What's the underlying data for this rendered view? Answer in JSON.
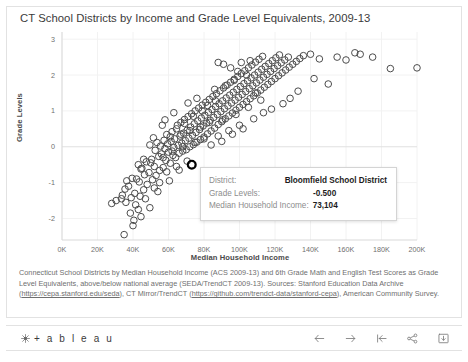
{
  "chart_title": "CT School Districts by Income and Grade Level Equivalents, 2009-13",
  "axis": {
    "ytitle": "Grade Levels",
    "xtitle": "Median Household Income",
    "xticks": [
      "0K",
      "20K",
      "40K",
      "60K",
      "80K",
      "100K",
      "120K",
      "140K",
      "160K",
      "180K",
      "200K"
    ],
    "yticks": [
      "3",
      "2",
      "1",
      "0",
      "-1",
      "-2"
    ]
  },
  "tooltip": {
    "district_label": "District:",
    "district_value": "Bloomfield School District",
    "grade_label": "Grade Levels:",
    "grade_value": "-0.500",
    "income_label": "Median Household Income:",
    "income_value": "73,104"
  },
  "caption": {
    "part1": "Connecticut School Districts by Median Household Income (ACS 2009-13) and 6th Grade Math and English Test Scores as Grade Level Equivalents, above/below national average (SEDA/TrendCT 2009-13). Sources: Stanford Education Data Archive (",
    "link1": "https://cepa.stanford.edu/seda",
    "part2": "), CT Mirror/TrendCT (",
    "link2": "https://github.com/trendct-data/stanford-cepa",
    "part3": "), American Community Survey."
  },
  "toolbar": {
    "brand": "+ a b l e a u",
    "icons": [
      {
        "name": "back-arrow-icon",
        "label": "Back"
      },
      {
        "name": "forward-arrow-icon",
        "label": "Forward"
      },
      {
        "name": "revert-icon",
        "label": "Revert"
      },
      {
        "name": "share-icon",
        "label": "Share"
      },
      {
        "name": "download-icon",
        "label": "Download"
      }
    ]
  },
  "colors": {
    "marker_stroke": "#4c4c4c",
    "highlight_stroke": "#000000",
    "grid": "#f2f2f2",
    "axis": "#d9d9d9",
    "text": "#6f6f6f"
  },
  "chart_data": {
    "type": "scatter",
    "title": "CT School Districts by Income and Grade Level Equivalents, 2009-13",
    "xlabel": "Median Household Income",
    "ylabel": "Grade Levels",
    "xlim": [
      0,
      200000
    ],
    "ylim": [
      -2.6,
      3.2
    ],
    "grid": true,
    "legend": null,
    "marker": "open-circle",
    "highlighted_point": {
      "label": "Bloomfield School District",
      "x": 73104,
      "y": -0.5
    },
    "points": [
      [
        35000,
        -2.45
      ],
      [
        40000,
        -2.2
      ],
      [
        38500,
        -1.85
      ],
      [
        43000,
        -1.75
      ],
      [
        41500,
        -1.62
      ],
      [
        36000,
        -1.55
      ],
      [
        28000,
        -1.58
      ],
      [
        33500,
        -1.45
      ],
      [
        39000,
        -1.42
      ],
      [
        44000,
        -1.38
      ],
      [
        41000,
        -1.3
      ],
      [
        46000,
        -1.2
      ],
      [
        35500,
        -1.18
      ],
      [
        48000,
        -1.05
      ],
      [
        43500,
        -0.98
      ],
      [
        51000,
        -0.92
      ],
      [
        39500,
        -0.88
      ],
      [
        53000,
        -0.8
      ],
      [
        46500,
        -0.78
      ],
      [
        49000,
        -0.72
      ],
      [
        55000,
        -0.66
      ],
      [
        44500,
        -0.62
      ],
      [
        57000,
        -0.58
      ],
      [
        52000,
        -0.55
      ],
      [
        73104,
        -0.5
      ],
      [
        61000,
        -0.46
      ],
      [
        47500,
        -0.42
      ],
      [
        58500,
        -0.38
      ],
      [
        50500,
        -0.35
      ],
      [
        64000,
        -0.3
      ],
      [
        54500,
        -0.27
      ],
      [
        62500,
        -0.24
      ],
      [
        56000,
        -0.2
      ],
      [
        66000,
        -0.18
      ],
      [
        60000,
        -0.15
      ],
      [
        68000,
        -0.12
      ],
      [
        52500,
        -0.1
      ],
      [
        70000,
        -0.08
      ],
      [
        58000,
        -0.05
      ],
      [
        63000,
        -0.02
      ],
      [
        72000,
        0.0
      ],
      [
        55500,
        0.02
      ],
      [
        65500,
        0.04
      ],
      [
        49500,
        0.05
      ],
      [
        74000,
        0.06
      ],
      [
        59500,
        0.08
      ],
      [
        67500,
        0.1
      ],
      [
        53500,
        0.12
      ],
      [
        76000,
        0.13
      ],
      [
        61500,
        0.15
      ],
      [
        69500,
        0.17
      ],
      [
        57500,
        0.18
      ],
      [
        78000,
        0.2
      ],
      [
        63500,
        0.22
      ],
      [
        71500,
        0.24
      ],
      [
        51500,
        0.25
      ],
      [
        80000,
        0.27
      ],
      [
        66500,
        0.3
      ],
      [
        73500,
        0.32
      ],
      [
        59000,
        0.34
      ],
      [
        82000,
        0.36
      ],
      [
        68500,
        0.38
      ],
      [
        75500,
        0.4
      ],
      [
        62000,
        0.42
      ],
      [
        84000,
        0.44
      ],
      [
        70500,
        0.46
      ],
      [
        77500,
        0.48
      ],
      [
        64500,
        0.5
      ],
      [
        86000,
        0.52
      ],
      [
        72500,
        0.55
      ],
      [
        79500,
        0.58
      ],
      [
        56500,
        0.6
      ],
      [
        88000,
        0.62
      ],
      [
        74500,
        0.64
      ],
      [
        81500,
        0.66
      ],
      [
        67000,
        0.68
      ],
      [
        90000,
        0.7
      ],
      [
        76500,
        0.72
      ],
      [
        83500,
        0.74
      ],
      [
        69000,
        0.76
      ],
      [
        92000,
        0.78
      ],
      [
        78500,
        0.8
      ],
      [
        85500,
        0.82
      ],
      [
        71000,
        0.84
      ],
      [
        94000,
        0.86
      ],
      [
        80500,
        0.88
      ],
      [
        87500,
        0.9
      ],
      [
        73000,
        0.92
      ],
      [
        96000,
        0.94
      ],
      [
        82500,
        0.96
      ],
      [
        89500,
        0.98
      ],
      [
        75000,
        1.0
      ],
      [
        98000,
        1.02
      ],
      [
        84500,
        1.04
      ],
      [
        91500,
        1.06
      ],
      [
        77000,
        1.08
      ],
      [
        100000,
        1.1
      ],
      [
        86500,
        1.12
      ],
      [
        93500,
        1.14
      ],
      [
        79000,
        1.16
      ],
      [
        102000,
        1.18
      ],
      [
        88500,
        1.2
      ],
      [
        95500,
        1.22
      ],
      [
        81000,
        1.24
      ],
      [
        104000,
        1.26
      ],
      [
        90500,
        1.28
      ],
      [
        97500,
        1.3
      ],
      [
        83000,
        1.32
      ],
      [
        106000,
        1.34
      ],
      [
        92500,
        1.36
      ],
      [
        99500,
        1.38
      ],
      [
        85000,
        1.4
      ],
      [
        108000,
        1.42
      ],
      [
        94500,
        1.44
      ],
      [
        101500,
        1.46
      ],
      [
        87000,
        1.48
      ],
      [
        110000,
        1.5
      ],
      [
        96500,
        1.52
      ],
      [
        103500,
        1.54
      ],
      [
        89000,
        1.56
      ],
      [
        112000,
        1.58
      ],
      [
        98500,
        1.6
      ],
      [
        105500,
        1.62
      ],
      [
        91000,
        1.64
      ],
      [
        114000,
        1.66
      ],
      [
        100500,
        1.68
      ],
      [
        107500,
        1.7
      ],
      [
        93000,
        1.72
      ],
      [
        116000,
        1.74
      ],
      [
        102500,
        1.76
      ],
      [
        109500,
        1.78
      ],
      [
        95000,
        1.8
      ],
      [
        118000,
        1.82
      ],
      [
        104500,
        1.84
      ],
      [
        111500,
        1.86
      ],
      [
        97000,
        1.88
      ],
      [
        120000,
        1.9
      ],
      [
        106500,
        1.92
      ],
      [
        113500,
        1.94
      ],
      [
        99000,
        1.96
      ],
      [
        122000,
        1.98
      ],
      [
        108500,
        2.0
      ],
      [
        115500,
        2.02
      ],
      [
        101000,
        2.04
      ],
      [
        124000,
        2.06
      ],
      [
        110500,
        2.08
      ],
      [
        117500,
        2.1
      ],
      [
        103000,
        2.12
      ],
      [
        126000,
        2.14
      ],
      [
        112500,
        2.16
      ],
      [
        119500,
        2.18
      ],
      [
        105000,
        2.2
      ],
      [
        128000,
        2.22
      ],
      [
        114500,
        2.24
      ],
      [
        121500,
        2.26
      ],
      [
        107000,
        2.28
      ],
      [
        130000,
        2.3
      ],
      [
        116500,
        2.32
      ],
      [
        123500,
        2.34
      ],
      [
        109000,
        2.36
      ],
      [
        132000,
        2.38
      ],
      [
        118500,
        2.4
      ],
      [
        125500,
        2.42
      ],
      [
        111000,
        2.44
      ],
      [
        134000,
        2.46
      ],
      [
        120500,
        2.48
      ],
      [
        127500,
        2.5
      ],
      [
        113000,
        2.52
      ],
      [
        136000,
        2.54
      ],
      [
        122500,
        2.56
      ],
      [
        140000,
        2.58
      ],
      [
        145000,
        2.45
      ],
      [
        155000,
        2.5
      ],
      [
        160000,
        2.42
      ],
      [
        165000,
        2.62
      ],
      [
        168000,
        2.58
      ],
      [
        175000,
        2.5
      ],
      [
        185000,
        2.18
      ],
      [
        200000,
        2.2
      ],
      [
        205000,
        2.3
      ],
      [
        142000,
        1.9
      ],
      [
        150000,
        1.75
      ],
      [
        133000,
        1.55
      ],
      [
        128500,
        1.35
      ],
      [
        124500,
        1.2
      ],
      [
        118000,
        1.05
      ],
      [
        113500,
        0.95
      ],
      [
        108000,
        0.78
      ],
      [
        100000,
        0.6
      ],
      [
        94000,
        0.45
      ],
      [
        88000,
        0.3
      ],
      [
        80000,
        0.22
      ],
      [
        75000,
        0.12
      ],
      [
        68000,
        0.0
      ],
      [
        62000,
        -0.12
      ],
      [
        57000,
        -0.3
      ],
      [
        50000,
        -0.45
      ],
      [
        45000,
        -0.6
      ],
      [
        42000,
        -0.9
      ],
      [
        37500,
        -1.1
      ],
      [
        34000,
        -1.35
      ],
      [
        30500,
        -1.5
      ],
      [
        47000,
        -1.45
      ],
      [
        44500,
        -1.95
      ],
      [
        40500,
        -2.05
      ],
      [
        49500,
        -1.7
      ],
      [
        54000,
        -1.25
      ],
      [
        52000,
        -1.15
      ],
      [
        36500,
        -0.95
      ],
      [
        43000,
        -0.5
      ],
      [
        46000,
        -0.35
      ],
      [
        59000,
        -0.7
      ],
      [
        64500,
        -0.55
      ],
      [
        70500,
        -0.4
      ],
      [
        66000,
        -0.65
      ],
      [
        60500,
        -0.95
      ],
      [
        55000,
        -1.0
      ],
      [
        84000,
        0.05
      ],
      [
        90000,
        0.15
      ],
      [
        96000,
        0.35
      ],
      [
        102000,
        0.5
      ],
      [
        86000,
        1.6
      ],
      [
        92000,
        1.7
      ],
      [
        97000,
        1.85
      ],
      [
        104000,
        2.0
      ],
      [
        99000,
        2.1
      ],
      [
        95000,
        2.2
      ],
      [
        91000,
        2.3
      ],
      [
        88000,
        2.35
      ],
      [
        101000,
        2.35
      ],
      [
        106000,
        2.4
      ],
      [
        109000,
        1.5
      ],
      [
        112000,
        1.3
      ],
      [
        105000,
        1.1
      ],
      [
        98000,
        0.9
      ],
      [
        90500,
        0.75
      ],
      [
        83000,
        0.68
      ],
      [
        78000,
        0.55
      ],
      [
        72000,
        0.45
      ],
      [
        67000,
        0.35
      ],
      [
        61000,
        0.28
      ],
      [
        65000,
        0.6
      ],
      [
        69000,
        0.65
      ],
      [
        74000,
        0.85
      ],
      [
        79000,
        1.0
      ],
      [
        82000,
        1.15
      ],
      [
        86500,
        1.28
      ],
      [
        76000,
        1.35
      ],
      [
        71000,
        1.22
      ],
      [
        63000,
        0.95
      ],
      [
        58000,
        0.75
      ]
    ]
  }
}
